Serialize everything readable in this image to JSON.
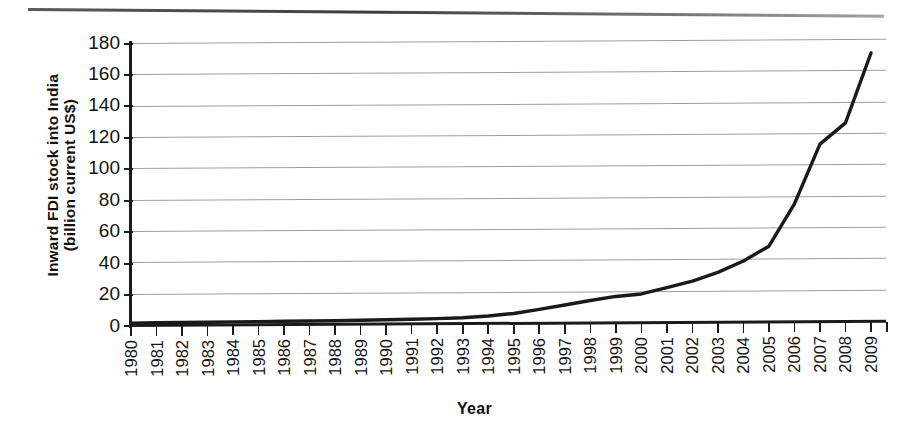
{
  "chart_data": {
    "type": "line",
    "title": "",
    "xlabel": "Year",
    "ylabel": "Inward FDI stock into India (billion current US$)",
    "ylabel_line1": "Inward FDI stock into India",
    "ylabel_line2": "(billion current US$)",
    "ylim": [
      0,
      180
    ],
    "ytick_step": 20,
    "yticks": [
      180,
      160,
      140,
      120,
      100,
      80,
      60,
      40,
      20,
      0
    ],
    "grid": true,
    "legend": "none",
    "line_color": "#1a1a1a",
    "line_width_px": 3.4,
    "categories": [
      "1980",
      "1981",
      "1982",
      "1983",
      "1984",
      "1985",
      "1986",
      "1987",
      "1988",
      "1989",
      "1990",
      "1991",
      "1992",
      "1993",
      "1994",
      "1995",
      "1996",
      "1997",
      "1998",
      "1999",
      "2000",
      "2001",
      "2002",
      "2003",
      "2004",
      "2005",
      "2006",
      "2007",
      "2008",
      "2009"
    ],
    "values": [
      1.2,
      1.3,
      1.4,
      1.5,
      1.6,
      1.7,
      1.8,
      1.9,
      2.0,
      2.2,
      2.4,
      2.7,
      3.0,
      3.4,
      4.5,
      6.0,
      8.5,
      11.2,
      14.0,
      16.5,
      18.0,
      22.0,
      26.0,
      31.5,
      38.7,
      48.0,
      75.0,
      113.0,
      126.5,
      171.0
    ],
    "series": [
      {
        "name": "Inward FDI stock into India",
        "values": [
          1.2,
          1.3,
          1.4,
          1.5,
          1.6,
          1.7,
          1.8,
          1.9,
          2.0,
          2.2,
          2.4,
          2.7,
          3.0,
          3.4,
          4.5,
          6.0,
          8.5,
          11.2,
          14.0,
          16.5,
          18.0,
          22.0,
          26.0,
          31.5,
          38.7,
          48.0,
          75.0,
          113.0,
          126.5,
          171.0
        ]
      }
    ],
    "units": "billion current US$",
    "x_range": [
      "1980",
      "2009"
    ],
    "n_points": 30
  }
}
